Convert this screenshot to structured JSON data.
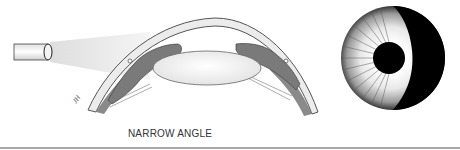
{
  "figure": {
    "caption": "NARROW ANGLE",
    "signature": "JH",
    "elements": {
      "light_source": "penlight-beam",
      "cross_section": "anterior-chamber-cross-section",
      "front_view": "eye-front-view-shadow-crescent"
    },
    "colors": {
      "background": "#ffffff",
      "iris_gray": "#7a7a7a",
      "cornea_fill": "#ececec",
      "outline": "#555555",
      "rule": "#a9a9a9",
      "shadow": "#000000"
    }
  }
}
